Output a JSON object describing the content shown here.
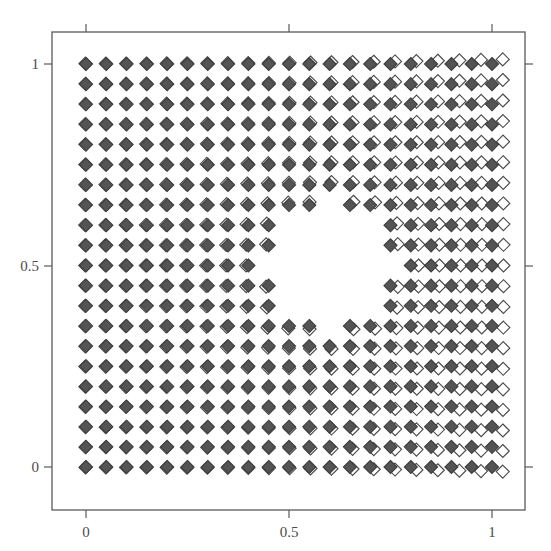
{
  "figure": {
    "background_color": "#ffffff",
    "frame_color": "#5a5a5a",
    "title": "",
    "xlabel": "",
    "ylabel": ""
  },
  "axes": {
    "frame": {
      "left": 52,
      "top": 32,
      "right": 525,
      "bottom": 510
    },
    "x_ticks": [
      {
        "value": 0,
        "label": "0",
        "px": 86
      },
      {
        "value": 0.5,
        "label": "0.5",
        "px": 289
      },
      {
        "value": 1,
        "label": "1",
        "px": 492
      }
    ],
    "y_ticks": [
      {
        "value": 0,
        "label": "0",
        "px": 467
      },
      {
        "value": 0.5,
        "label": "0.5",
        "px": 266
      },
      {
        "value": 1,
        "label": "1",
        "px": 64
      }
    ],
    "tick_length": 8,
    "tick_color": "#5a5a5a",
    "label_color": "#4a4a4a"
  },
  "chart_data": {
    "type": "scatter",
    "title": "",
    "xlabel": "",
    "ylabel": "",
    "xlim": [
      -0.09,
      1.16
    ],
    "ylim": [
      -0.09,
      1.16
    ],
    "xtick_labels": [
      "0",
      "0.5",
      "1"
    ],
    "ytick_labels": [
      "0",
      "0.5",
      "1"
    ],
    "xticks": [
      0,
      0.5,
      1
    ],
    "yticks": [
      0,
      0.5,
      1
    ],
    "grid": false,
    "legend": "none",
    "series": [
      {
        "name": "reference-grid",
        "marker": "diamond-filled",
        "color": "#545454",
        "edge_color": "#3f3f3f",
        "size_px": 13,
        "count": 441
      },
      {
        "name": "displaced-grid",
        "marker": "diamond-open",
        "color": "#ffffff",
        "edge_color": "#4a4a4a",
        "size_px": 13,
        "count": 441
      }
    ],
    "grid_spec": {
      "nx": 21,
      "ny": 21,
      "x_min": 0,
      "x_max": 1,
      "y_min": 0,
      "y_max": 1
    },
    "void": {
      "shape": "circle",
      "center_x": 0.6,
      "center_y": 0.5,
      "radius": 0.155,
      "description": "circular region empty of markers"
    },
    "deformation": {
      "model": "radial-outward-displacement-around-circular-inclusion",
      "strength": 0.052,
      "shear": 0.028,
      "note": "open markers are offset from filled markers; offset grows toward the right side"
    }
  }
}
